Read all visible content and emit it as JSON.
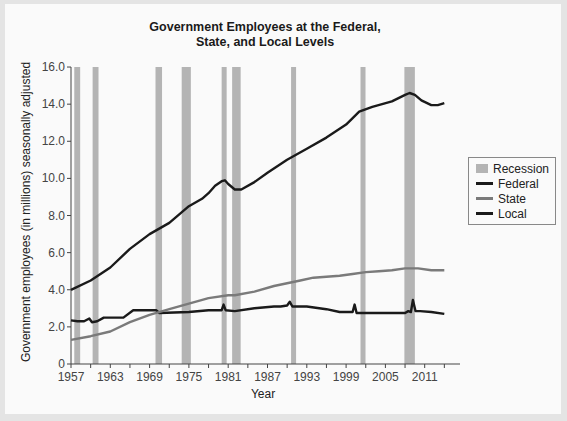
{
  "chart_data": {
    "type": "line",
    "title": "Government Employees at the Federal, State, and Local Levels",
    "title_lines": [
      "Government Employees at the Federal,",
      "State, and Local Levels"
    ],
    "xlabel": "Year",
    "ylabel": "Government employees (in millions) seasonally adjusted",
    "xlim": [
      1957,
      2014
    ],
    "ylim": [
      0,
      16
    ],
    "x_ticks": [
      1957,
      1963,
      1969,
      1975,
      1981,
      1987,
      1993,
      1999,
      2005,
      2011
    ],
    "y_ticks": [
      0,
      2.0,
      4.0,
      6.0,
      8.0,
      10.0,
      12.0,
      14.0,
      16.0
    ],
    "y_tick_labels": [
      "0",
      "2.0",
      "4.0",
      "6.0",
      "8.0",
      "10.0",
      "12.0",
      "14.0",
      "16.0"
    ],
    "grid": false,
    "legend_position": "right",
    "legend": [
      "Recession",
      "Federal",
      "State",
      "Local"
    ],
    "recessions": [
      [
        1957.5,
        1958.4
      ],
      [
        1960.3,
        1961.2
      ],
      [
        1969.9,
        1970.9
      ],
      [
        1973.9,
        1975.3
      ],
      [
        1980.0,
        1980.7
      ],
      [
        1981.6,
        1982.9
      ],
      [
        1990.6,
        1991.3
      ],
      [
        2001.2,
        2001.9
      ],
      [
        2007.9,
        2009.5
      ]
    ],
    "series": [
      {
        "name": "Federal",
        "color": "#1a1a1a",
        "x": [
          1957,
          1958,
          1959,
          1959.8,
          1960.2,
          1961,
          1962,
          1965,
          1966.5,
          1970,
          1970.5,
          1975,
          1978,
          1980,
          1980.3,
          1980.6,
          1982,
          1985,
          1988,
          1989,
          1990,
          1990.4,
          1990.8,
          1993,
          1996,
          1998,
          2000,
          2000.3,
          2000.6,
          2003,
          2006,
          2008,
          2008.5,
          2008.9,
          2009.2,
          2009.6,
          2010.3,
          2012,
          2014
        ],
        "values": [
          2.35,
          2.3,
          2.3,
          2.45,
          2.25,
          2.3,
          2.5,
          2.5,
          2.9,
          2.9,
          2.75,
          2.8,
          2.9,
          2.9,
          3.2,
          2.9,
          2.85,
          3.0,
          3.1,
          3.1,
          3.15,
          3.35,
          3.1,
          3.1,
          2.95,
          2.8,
          2.8,
          3.2,
          2.75,
          2.75,
          2.75,
          2.75,
          2.85,
          2.8,
          3.45,
          2.85,
          2.85,
          2.8,
          2.7
        ]
      },
      {
        "name": "State",
        "color": "#7a7a7a",
        "x": [
          1957,
          1960,
          1963,
          1966,
          1969,
          1972,
          1975,
          1978,
          1981,
          1982,
          1985,
          1988,
          1990,
          1992,
          1994,
          1996,
          1998,
          2000,
          2002,
          2004,
          2006,
          2008,
          2010,
          2012,
          2014
        ],
        "values": [
          1.3,
          1.5,
          1.75,
          2.25,
          2.65,
          2.95,
          3.25,
          3.55,
          3.7,
          3.7,
          3.9,
          4.2,
          4.35,
          4.5,
          4.65,
          4.7,
          4.75,
          4.85,
          4.95,
          5.0,
          5.05,
          5.15,
          5.15,
          5.05,
          5.05
        ]
      },
      {
        "name": "Local",
        "color": "#1a1a1a",
        "x": [
          1957,
          1960,
          1963,
          1966,
          1969,
          1972,
          1975,
          1977,
          1978,
          1979,
          1980,
          1980.5,
          1981,
          1982,
          1983,
          1985,
          1987,
          1990,
          1993,
          1996,
          1999,
          2001,
          2003,
          2006,
          2008,
          2008.7,
          2009.5,
          2010.5,
          2012,
          2013,
          2014
        ],
        "values": [
          4.0,
          4.5,
          5.2,
          6.2,
          7.0,
          7.6,
          8.5,
          8.9,
          9.2,
          9.6,
          9.85,
          9.9,
          9.7,
          9.4,
          9.4,
          9.8,
          10.3,
          11.0,
          11.6,
          12.2,
          12.9,
          13.6,
          13.85,
          14.15,
          14.5,
          14.6,
          14.5,
          14.2,
          13.95,
          13.95,
          14.05
        ]
      }
    ]
  }
}
